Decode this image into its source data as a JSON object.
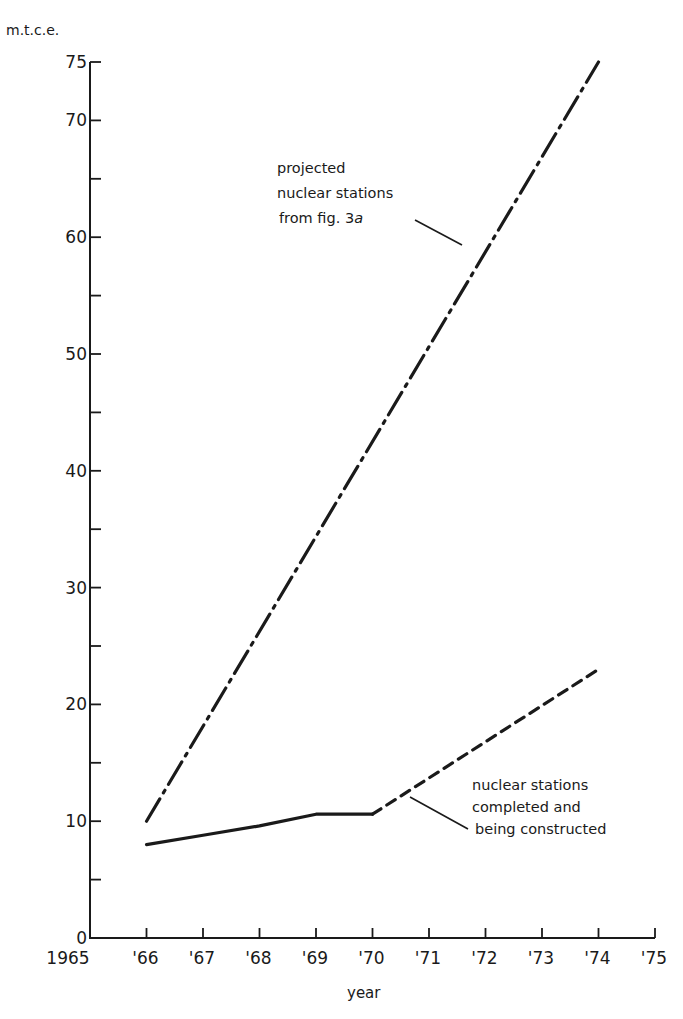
{
  "chart_data": {
    "type": "line",
    "title": "",
    "xlabel": "year",
    "ylabel": "m.t.c.e.",
    "xlim": [
      1965,
      1975
    ],
    "ylim": [
      0,
      75
    ],
    "grid": false,
    "x_ticks": [
      1965,
      1966,
      1967,
      1968,
      1969,
      1970,
      1971,
      1972,
      1973,
      1974,
      1975
    ],
    "x_tick_labels": [
      "1965",
      "'66",
      "'67",
      "'68",
      "'69",
      "'70",
      "'71",
      "'72",
      "'73",
      "'74",
      "'75"
    ],
    "y_major_ticks": [
      0,
      10,
      20,
      30,
      40,
      50,
      60,
      70,
      75
    ],
    "y_tick_labels": [
      "0",
      "10",
      "20",
      "30",
      "40",
      "50",
      "60",
      "70",
      "75"
    ],
    "y_minor_ticks": [
      5,
      15,
      25,
      35,
      45,
      55,
      65
    ],
    "series": [
      {
        "name": "projected nuclear stations from fig. 3a",
        "style": "dash-dot",
        "x": [
          1966,
          1974
        ],
        "values": [
          10,
          75
        ]
      },
      {
        "name": "nuclear stations completed and being constructed",
        "style": "solid",
        "x": [
          1966,
          1967,
          1968,
          1969,
          1970
        ],
        "values": [
          8,
          8.8,
          9.6,
          10.6,
          10.6
        ]
      },
      {
        "name": "nuclear stations completed and being constructed (projected)",
        "style": "dashed",
        "x": [
          1970,
          1974
        ],
        "values": [
          10.6,
          23
        ]
      }
    ],
    "annotations": [
      {
        "lines": [
          "projected",
          "nuclear stations",
          "from fig. 3a"
        ],
        "points_to": "dash-dot series near 1972"
      },
      {
        "lines": [
          "nuclear stations",
          "completed and",
          "being constructed"
        ],
        "points_to": "dashed series near 1970.7"
      }
    ],
    "legend": "none (inline annotations)"
  },
  "labels": {
    "unit": "m.t.c.e.",
    "xlabel": "year",
    "annotation_projected": [
      "projected",
      "nuclear stations",
      "from fig. 3"
    ],
    "annotation_projected_suffix": "a",
    "annotation_completed": [
      "nuclear stations",
      "completed and",
      "being constructed"
    ]
  }
}
